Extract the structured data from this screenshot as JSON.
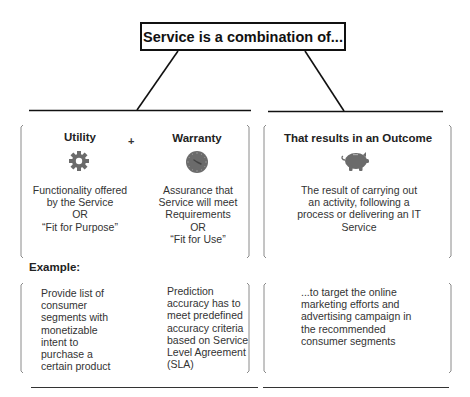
{
  "title": "Service is a combination of...",
  "connector": "+",
  "utility": {
    "heading": "Utility",
    "icon": "gear-icon",
    "lines": [
      "Functionality offered",
      "by the Service",
      "OR",
      "“Fit for Purpose”"
    ]
  },
  "warranty": {
    "heading": "Warranty",
    "icon": "clock-icon",
    "lines": [
      "Assurance that",
      "Service will meet",
      "Requirements",
      "OR",
      "“Fit for Use”"
    ]
  },
  "outcome": {
    "heading": "That results in an Outcome",
    "icon": "piggy-bank-icon",
    "lines": [
      "The result of carrying out",
      "an activity, following a",
      "process or delivering an IT",
      "Service"
    ]
  },
  "example": {
    "label": "Example:",
    "utility_lines": [
      "Provide list of",
      "consumer",
      "segments with",
      "monetizable",
      "intent to",
      "purchase a",
      "certain product"
    ],
    "warranty_lines": [
      "Prediction",
      "accuracy has to",
      "meet predefined",
      "accuracy criteria",
      "based on Service",
      "Level Agreement",
      "(SLA)"
    ],
    "outcome_lines": [
      "...to target the online",
      "marketing efforts and",
      "advertising campaign in",
      "the recommended",
      "consumer segments"
    ]
  },
  "colors": {
    "icon": "#6b6b6b",
    "line": "#111111",
    "bracket": "#8a8a8a"
  }
}
